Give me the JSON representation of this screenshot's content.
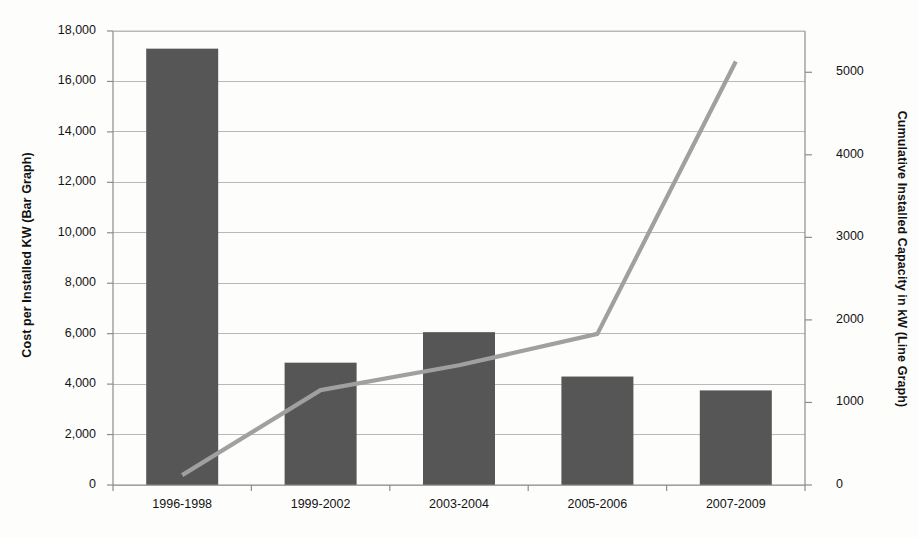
{
  "title": "",
  "chart_data": {
    "type": "bar",
    "title": "",
    "subtitle": "",
    "xlabel": "",
    "ylabel": "Cost per Installed KW (Bar Graph)",
    "y2label": "Cumulative Installed Capacity in kW (Line Graph)",
    "categories": [
      "1996-1998",
      "1999-2002",
      "2003-2004",
      "2005-2006",
      "2007-2009"
    ],
    "ylim": [
      0,
      18000
    ],
    "y2lim": [
      0,
      5500
    ],
    "yticks": [
      "0",
      "2,000",
      "4,000",
      "6,000",
      "8,000",
      "10,000",
      "12,000",
      "14,000",
      "16,000",
      "18,000"
    ],
    "ytick_values": [
      0,
      2000,
      4000,
      6000,
      8000,
      10000,
      12000,
      14000,
      16000,
      18000
    ],
    "y2ticks": [
      "0",
      "1000",
      "2000",
      "3000",
      "4000",
      "5000"
    ],
    "y2tick_values": [
      0,
      1000,
      2000,
      3000,
      4000,
      5000
    ],
    "grid": true,
    "legend": "none",
    "series": [
      {
        "name": "Cost per Installed KW (Bar Graph)",
        "kind": "bar",
        "axis": "left",
        "color": "#565656",
        "values": [
          17300,
          4850,
          6060,
          4300,
          3750
        ]
      },
      {
        "name": "Cumulative Installed Capacity in kW (Line Graph)",
        "kind": "line",
        "axis": "right",
        "color": "#a0a0a0",
        "values": [
          120,
          1150,
          1450,
          1830,
          5130
        ]
      }
    ]
  },
  "colors": {
    "bar": "#565656",
    "line": "#a0a0a0",
    "grid": "#b9b9b9",
    "axis": "#8c8c8c",
    "background": "#fdfdfc",
    "text": "#141414"
  }
}
